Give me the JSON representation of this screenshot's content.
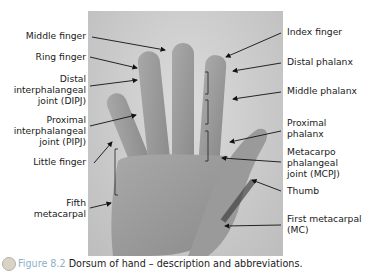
{
  "figure": {
    "number": "Figure 8.2",
    "caption": "Dorsum of hand – description and abbreviations.",
    "accent_color": "#8cb0c8"
  },
  "labels_left": [
    {
      "id": "middle-finger",
      "lines": [
        "Middle finger"
      ]
    },
    {
      "id": "ring-finger",
      "lines": [
        "Ring finger"
      ]
    },
    {
      "id": "dipj",
      "lines": [
        "Distal",
        "interphalangeal",
        "joint (DIPJ)"
      ]
    },
    {
      "id": "pipj",
      "lines": [
        "Proximal",
        "interphalangeal",
        "joint (PIPJ)"
      ]
    },
    {
      "id": "little-finger",
      "lines": [
        "Little finger"
      ]
    },
    {
      "id": "fifth-metacarpal",
      "lines": [
        "Fifth",
        "metacarpal"
      ]
    }
  ],
  "labels_right": [
    {
      "id": "index-finger",
      "lines": [
        "Index finger"
      ]
    },
    {
      "id": "distal-phalanx",
      "lines": [
        "Distal phalanx"
      ]
    },
    {
      "id": "middle-phalanx",
      "lines": [
        "Middle phalanx"
      ]
    },
    {
      "id": "proximal-phalanx",
      "lines": [
        "Proximal",
        "phalanx"
      ]
    },
    {
      "id": "mcpj",
      "lines": [
        "Metacarpo",
        "phalangeal",
        "joint (MCPJ)"
      ]
    },
    {
      "id": "thumb",
      "lines": [
        "Thumb"
      ]
    },
    {
      "id": "first-metacarpal",
      "lines": [
        "First metacarpal",
        "(MC)"
      ]
    }
  ]
}
